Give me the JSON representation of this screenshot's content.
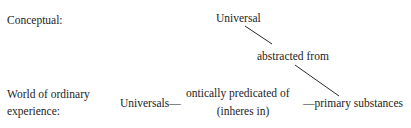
{
  "diagram": {
    "background_color": "#ffffff",
    "text_color": "#232323",
    "line_color": "#2a2a2a",
    "rows": {
      "conceptual_label": "Conceptual:",
      "world_label_line1": "World of ordinary",
      "world_label_line2": "experience:"
    },
    "nodes": {
      "universal": "Universal",
      "universals": "Universals—",
      "primary_substances": "—primary substances"
    },
    "relations": {
      "abstracted_from": "abstracted from",
      "ontically_predicated_of": "ontically predicated of",
      "inheres_in": "(inheres in)"
    },
    "edges": [
      {
        "name": "universal-to-abstracted",
        "x1": 245,
        "y1": 26,
        "x2": 272,
        "y2": 44
      },
      {
        "name": "abstracted-to-primary",
        "x1": 295,
        "y1": 65,
        "x2": 339,
        "y2": 96
      }
    ]
  }
}
